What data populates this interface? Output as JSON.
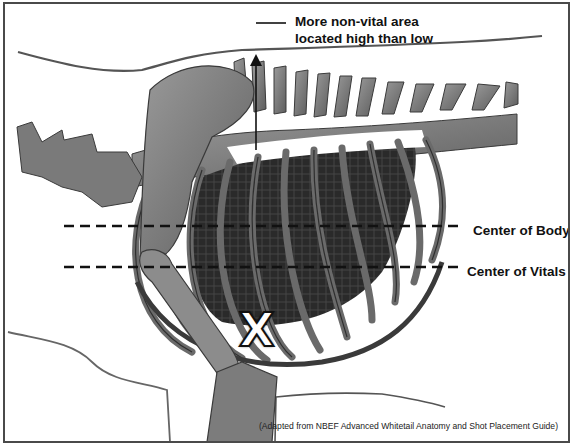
{
  "diagram": {
    "callouts": {
      "top_line1": "More non-vital area",
      "top_line2": "located high than low",
      "center_of_body": "Center of Body",
      "center_of_vitals": "Center of Vitals"
    },
    "marker": {
      "symbol": "X",
      "meaning": "recommended shot placement"
    },
    "credit": "(Adapted from NBEF Advanced Whitetail Anatomy and Shot Placement Guide)",
    "colors": {
      "bone": "#8a8a8a",
      "bone_dark": "#3a3a3a",
      "vitals": "#1a1a1a",
      "outline": "#555555",
      "frame": "#4a4a4a",
      "text": "#111111"
    },
    "guides": {
      "center_of_body_y": 224,
      "center_of_vitals_y": 265,
      "arrow_x": 254
    }
  }
}
